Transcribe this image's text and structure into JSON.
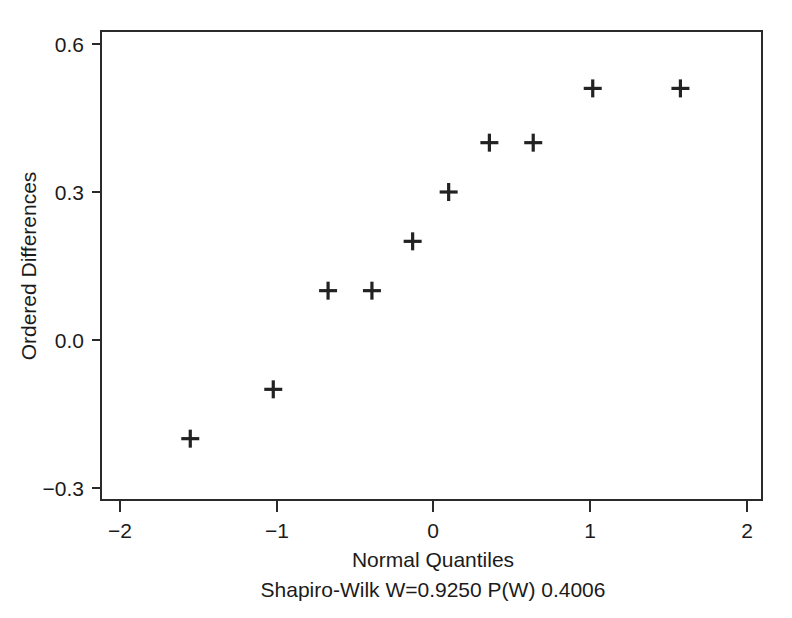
{
  "chart_data": {
    "type": "scatter",
    "title": "",
    "xlabel": "Normal Quantiles",
    "ylabel": "Ordered Differences",
    "xlim": [
      -2.35,
      2.15
    ],
    "ylim": [
      -0.38,
      0.69
    ],
    "xticks": [
      -2,
      -1,
      0,
      1,
      2
    ],
    "xticklabels": [
      "−2",
      "−1",
      "0",
      "1",
      "2"
    ],
    "yticks": [
      -0.3,
      0.0,
      0.3,
      0.6
    ],
    "yticklabels": [
      "−0.3",
      "0.0",
      "0.3",
      "0.6"
    ],
    "grid": false,
    "legend": null,
    "marker": "plus",
    "marker_color": "#222222",
    "x": [
      -1.55,
      -1.02,
      -0.67,
      -0.39,
      -0.13,
      0.1,
      0.36,
      0.64,
      1.02,
      1.58
    ],
    "y": [
      -0.2,
      -0.1,
      0.1,
      0.1,
      0.2,
      0.3,
      0.4,
      0.4,
      0.51,
      0.51
    ],
    "points": [
      {
        "x": -1.55,
        "y": -0.2
      },
      {
        "x": -1.02,
        "y": -0.1
      },
      {
        "x": -0.67,
        "y": 0.1
      },
      {
        "x": -0.39,
        "y": 0.1
      },
      {
        "x": -0.13,
        "y": 0.2
      },
      {
        "x": 0.1,
        "y": 0.3
      },
      {
        "x": 0.36,
        "y": 0.4
      },
      {
        "x": 0.64,
        "y": 0.4
      },
      {
        "x": 1.02,
        "y": 0.51
      },
      {
        "x": 1.58,
        "y": 0.51
      }
    ],
    "annotations": [
      {
        "name": "shapiro-wilk-caption",
        "text": "Shapiro-Wilk W=0.9250  P(W) 0.4006"
      }
    ],
    "statistics": {
      "test_name": "Shapiro-Wilk",
      "W": "0.9250",
      "P(W)": "0.4006"
    }
  },
  "figure": {
    "caption": "Shapiro-Wilk W=0.9250  P(W) 0.4006",
    "background_color": "#ffffff",
    "axis_color": "#2a2a2a",
    "text_color": "#1b1b1b"
  }
}
